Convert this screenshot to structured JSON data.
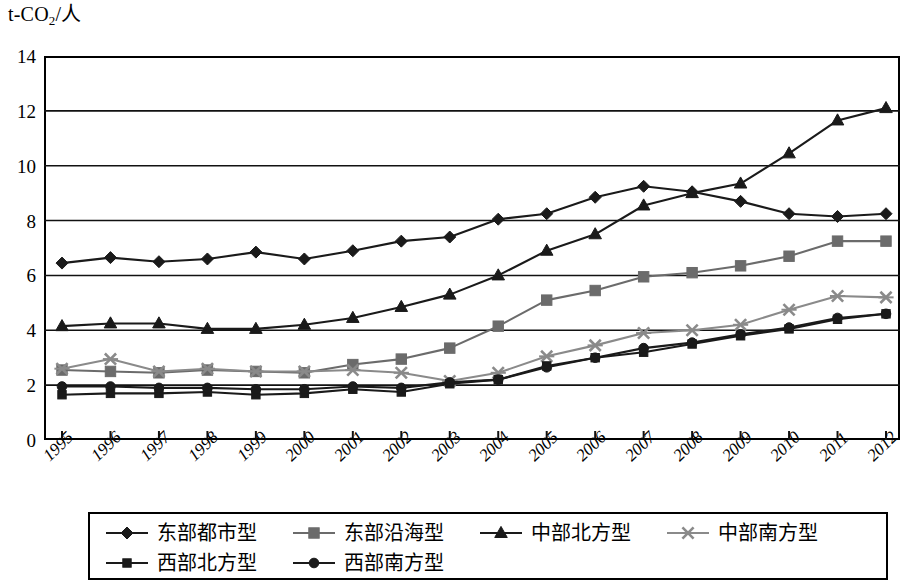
{
  "chart_data": {
    "type": "line",
    "title": "",
    "ylabel": "t-CO2/人",
    "ylabel_main": "t-CO",
    "ylabel_sub": "2",
    "ylabel_tail": "/人",
    "xlabel": "",
    "ylim": [
      0,
      14
    ],
    "ytick_step": 2,
    "yticks": [
      "0",
      "2",
      "4",
      "6",
      "8",
      "10",
      "12",
      "14"
    ],
    "grid": true,
    "legend_position": "bottom",
    "categories": [
      "1995",
      "1996",
      "1997",
      "1998",
      "1999",
      "2000",
      "2001",
      "2002",
      "2003",
      "2004",
      "2005",
      "2006",
      "2007",
      "2008",
      "2009",
      "2010",
      "2011",
      "2012"
    ],
    "series": [
      {
        "name": "东部都市型",
        "marker": "diamond",
        "color": "#1a1a1a",
        "values": [
          6.45,
          6.65,
          6.5,
          6.6,
          6.85,
          6.6,
          6.9,
          7.25,
          7.4,
          8.05,
          8.25,
          8.85,
          9.25,
          9.05,
          8.7,
          8.25,
          8.15,
          8.25
        ]
      },
      {
        "name": "东部沿海型",
        "marker": "square",
        "color": "#6b6b6b",
        "values": [
          2.55,
          2.5,
          2.45,
          2.55,
          2.5,
          2.45,
          2.75,
          2.95,
          3.35,
          4.15,
          5.1,
          5.45,
          5.95,
          6.1,
          6.35,
          6.7,
          7.25,
          7.25
        ]
      },
      {
        "name": "中部北方型",
        "marker": "triangle",
        "color": "#1a1a1a",
        "values": [
          4.15,
          4.25,
          4.25,
          4.05,
          4.05,
          4.2,
          4.45,
          4.85,
          5.3,
          6.0,
          6.9,
          7.5,
          8.55,
          9.0,
          9.35,
          10.45,
          11.65,
          12.1
        ]
      },
      {
        "name": "中部南方型",
        "marker": "cross",
        "color": "#8a8a8a",
        "values": [
          2.6,
          2.95,
          2.5,
          2.6,
          2.5,
          2.5,
          2.55,
          2.45,
          2.15,
          2.45,
          3.05,
          3.45,
          3.9,
          4.0,
          4.2,
          4.75,
          5.25,
          5.2
        ]
      },
      {
        "name": "西部北方型",
        "marker": "small-square",
        "color": "#1a1a1a",
        "values": [
          1.65,
          1.7,
          1.7,
          1.75,
          1.65,
          1.7,
          1.85,
          1.75,
          2.05,
          2.2,
          2.7,
          3.0,
          3.2,
          3.5,
          3.8,
          4.05,
          4.4,
          4.6
        ]
      },
      {
        "name": "西部南方型",
        "marker": "circle",
        "color": "#1a1a1a",
        "values": [
          1.95,
          1.95,
          1.9,
          1.9,
          1.85,
          1.85,
          1.95,
          1.9,
          2.1,
          2.2,
          2.65,
          3.0,
          3.35,
          3.55,
          3.85,
          4.1,
          4.45,
          4.6
        ]
      }
    ]
  },
  "legend": {
    "rows": [
      [
        {
          "label": "东部都市型",
          "marker": "diamond",
          "color": "#1a1a1a"
        },
        {
          "label": "东部沿海型",
          "marker": "square",
          "color": "#6b6b6b"
        },
        {
          "label": "中部北方型",
          "marker": "triangle",
          "color": "#1a1a1a"
        },
        {
          "label": "中部南方型",
          "marker": "cross",
          "color": "#8a8a8a"
        }
      ],
      [
        {
          "label": "西部北方型",
          "marker": "small-square",
          "color": "#1a1a1a"
        },
        {
          "label": "西部南方型",
          "marker": "circle",
          "color": "#1a1a1a"
        }
      ]
    ]
  }
}
